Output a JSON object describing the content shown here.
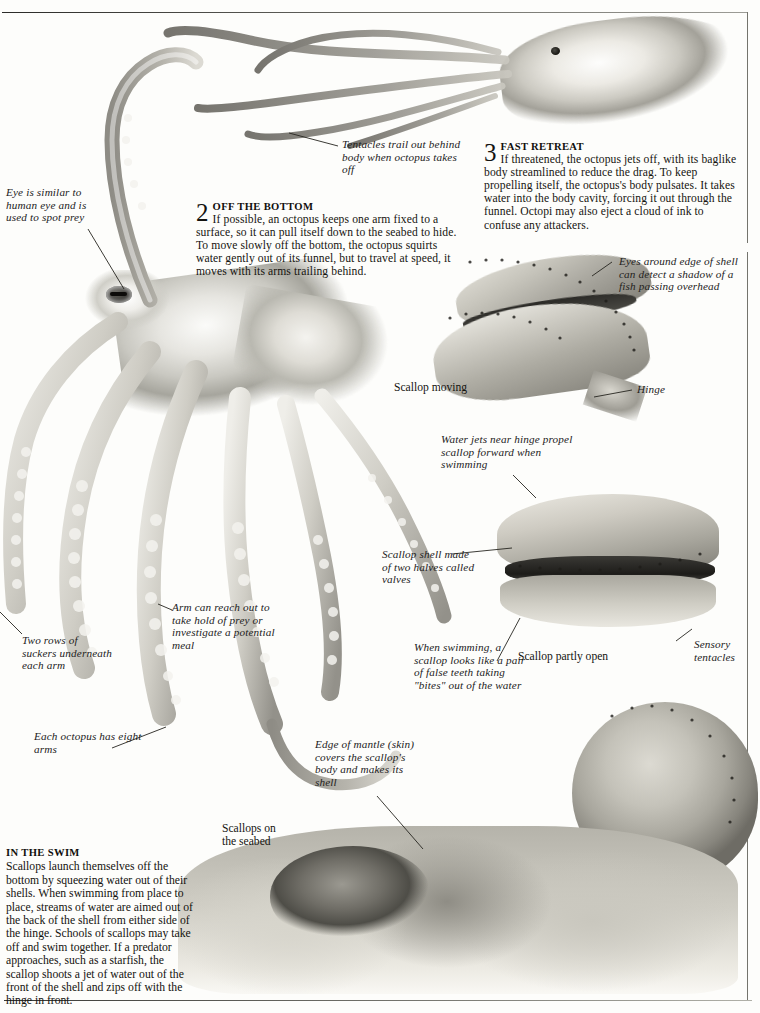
{
  "page": {
    "background_color": "#fdfdfb",
    "rule_color": "#74746d"
  },
  "sections": [
    {
      "number": "2",
      "heading": "OFF THE BOTTOM",
      "body": "If possible, an octopus keeps one arm fixed to a surface, so it can pull itself down to the seabed to hide. To move slowly off the bottom, the octopus squirts water gently out of its funnel, but to travel at speed, it moves with its arms trailing behind."
    },
    {
      "number": "3",
      "heading": "FAST RETREAT",
      "body": "If threatened, the octopus jets off, with its baglike body streamlined to reduce the drag. To keep propelling itself, the octopus's body pulsates. It takes water into the body cavity, forcing it out through the funnel. Octopi may also eject a cloud of ink to confuse any attackers."
    }
  ],
  "in_the_swim": {
    "heading": "IN THE SWIM",
    "body": "Scallops launch themselves off the bottom by squeezing water out of their shells. When swimming from place to place, streams of water are aimed out of the back of the shell from either side of the hinge. Schools of scallops may take off and swim together. If a predator approaches, such as a starfish, the scallop shoots a jet of water out of the front of the shell and zips off with the hinge in front."
  },
  "labels": {
    "tentacles_trail": "Tentacles trail out behind body when octopus takes off",
    "eye_similar": "Eye is similar to human eye and is used to spot prey",
    "two_rows": "Two rows of suckers underneath each arm",
    "arm_reach": "Arm can reach out to take hold of prey or investigate a potential meal",
    "each_octopus": "Each octopus has eight arms",
    "eyes_around_edge": "Eyes around edge of shell can detect a shadow of a fish passing overhead",
    "hinge": "Hinge",
    "water_jets": "Water jets near hinge propel scallop forward when swimming",
    "scallop_shell": "Scallop shell made of two halves called valves",
    "when_swimming": "When swimming, a scallop looks like a pair of false teeth taking \"bites\" out of the water",
    "sensory_tentacles": "Sensory tentacles",
    "edge_of_mantle": "Edge of mantle (skin) covers the scallop's body and makes its shell"
  },
  "captions": {
    "scallop_moving": "Scallop moving",
    "scallop_partly_open": "Scallop partly open",
    "scallops_on_seabed": "Scallops on\nthe seabed"
  },
  "images": [
    {
      "name": "swimming-octopus-photo",
      "alt": "Octopus jetting with tentacles trailing behind"
    },
    {
      "name": "octopus-photo",
      "alt": "Large octopus with eight arms and visible eye"
    },
    {
      "name": "scallop-moving-photo",
      "alt": "Scallop with shell open, moving"
    },
    {
      "name": "scallop-partly-open-photo",
      "alt": "Scallop shell partly open showing sensory tentacles"
    },
    {
      "name": "scallop-round-photo",
      "alt": "Round scallop shell seen from the side"
    },
    {
      "name": "scallops-seabed-photo",
      "alt": "Group of scallops resting on the seabed"
    }
  ]
}
